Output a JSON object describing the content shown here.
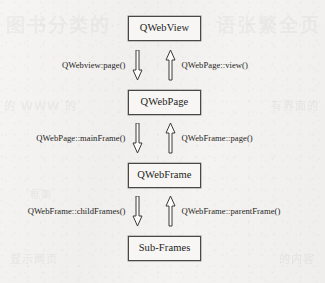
{
  "diagram": {
    "colors": {
      "page_background": "#f3f2f0",
      "box_fill": "#f7f6f4",
      "box_border": "#4a4845",
      "text": "#1d1c1b",
      "arrow_stroke": "#3c3a38",
      "arrow_fill": "#ffffff"
    },
    "nodes": [
      {
        "id": "qwebview",
        "label": "QWebView"
      },
      {
        "id": "qwebpage",
        "label": "QWebPage"
      },
      {
        "id": "qwebframe",
        "label": "QWebFrame"
      },
      {
        "id": "subframes",
        "label": "Sub-Frames"
      }
    ],
    "edges": [
      {
        "from": "qwebview",
        "to": "qwebpage",
        "down_label": "QWebview:page()",
        "up_label": "QWebPage::view()",
        "down_icon": "arrow-down-icon",
        "up_icon": "arrow-up-icon"
      },
      {
        "from": "qwebpage",
        "to": "qwebframe",
        "down_label": "QWebPage::mainFrame()",
        "up_label": "QWebFrame::page()",
        "down_icon": "arrow-down-icon",
        "up_icon": "arrow-up-icon"
      },
      {
        "from": "qwebframe",
        "to": "subframes",
        "down_label": "QWebFrame::childFrames()",
        "up_label": "QWebFrame::parentFrame()",
        "down_icon": "arrow-down-icon",
        "up_icon": "arrow-up-icon"
      }
    ]
  },
  "watermark": {
    "top_left": "图书分类的",
    "top_right": "语张繁全页",
    "mid_left": "的 WWW 的",
    "mid_right": "有界面的",
    "bottom_left": "显示网页",
    "bottom_right": "的内容",
    "center": "框架"
  }
}
